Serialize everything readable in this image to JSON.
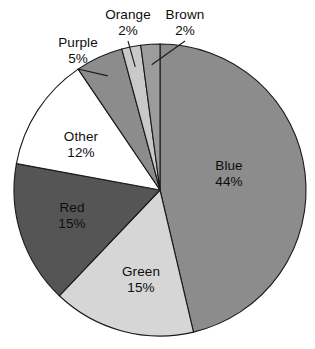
{
  "chart_data": {
    "type": "pie",
    "title": "",
    "subtitle": "",
    "xlabel": "",
    "ylabel": "",
    "legend_position": "none",
    "grid": false,
    "start_angle_deg": 0,
    "direction": "clockwise",
    "total_percent": 95,
    "categories": [
      "Blue",
      "Green",
      "Red",
      "Other",
      "Purple",
      "Orange",
      "Brown"
    ],
    "values": [
      44,
      15,
      15,
      12,
      5,
      2,
      2
    ],
    "labels": [
      "Blue 44%",
      "Green 15%",
      "Red 15%",
      "Other 12%",
      "Purple 5%",
      "Orange 2%",
      "Brown 2%"
    ],
    "slices": [
      {
        "name": "Blue",
        "label": "Blue",
        "percent_text": "44%",
        "value": 44,
        "fill": "#8c8c8c",
        "label_placement": "inside",
        "label_x": 229,
        "label_y": 170,
        "label_x2": 229,
        "label_y2": 186
      },
      {
        "name": "Green",
        "label": "Green",
        "percent_text": "15%",
        "value": 15,
        "fill": "#d6d6d6",
        "label_placement": "inside",
        "label_x": 141,
        "label_y": 276,
        "label_x2": 141,
        "label_y2": 292
      },
      {
        "name": "Red",
        "label": "Red",
        "percent_text": "15%",
        "value": 15,
        "fill": "#555555",
        "label_placement": "inside",
        "label_x": 72,
        "label_y": 212,
        "label_x2": 72,
        "label_y2": 228
      },
      {
        "name": "Other",
        "label": "Other",
        "percent_text": "12%",
        "value": 12,
        "fill": "#ffffff",
        "label_placement": "inside",
        "label_x": 81,
        "label_y": 141,
        "label_x2": 81,
        "label_y2": 157
      },
      {
        "name": "Purple",
        "label": "Purple",
        "percent_text": "5%",
        "value": 5,
        "fill": "#8c8c8c",
        "label_placement": "outside",
        "label_x": 78,
        "label_y": 47,
        "label_x2": 78,
        "label_y2": 63
      },
      {
        "name": "Orange",
        "label": "Orange",
        "percent_text": "2%",
        "value": 2,
        "fill": "#c9c9c9",
        "label_placement": "outside",
        "label_x": 128,
        "label_y": 19,
        "label_x2": 128,
        "label_y2": 35
      },
      {
        "name": "Brown",
        "label": "Brown",
        "percent_text": "2%",
        "value": 2,
        "fill": "#9c9c9c",
        "label_placement": "outside",
        "label_x": 185,
        "label_y": 19,
        "label_x2": 185,
        "label_y2": 35
      }
    ],
    "geometry": {
      "center_x": 160,
      "center_y": 190,
      "radius": 146
    },
    "colors": {
      "background": "#ffffff",
      "outline": "#1a1a1a",
      "text": "#0d0d0d"
    }
  }
}
